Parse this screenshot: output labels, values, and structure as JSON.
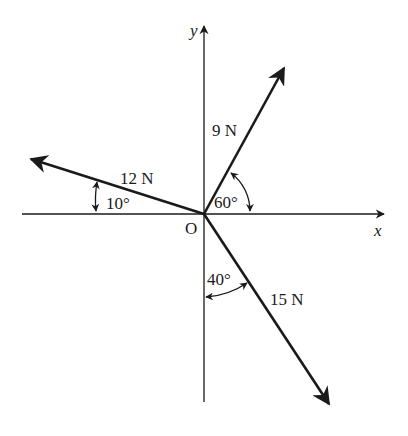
{
  "diagram": {
    "type": "force-vector-diagram",
    "origin_label": "O",
    "axes": {
      "x_label": "x",
      "y_label": "y"
    },
    "forces": [
      {
        "magnitude_label": "9 N",
        "angle_label": "60°",
        "angle_reference": "from positive x-axis",
        "direction": "upper-right"
      },
      {
        "magnitude_label": "12 N",
        "angle_label": "10°",
        "angle_reference": "above negative x-axis",
        "direction": "upper-left"
      },
      {
        "magnitude_label": "15 N",
        "angle_label": "40°",
        "angle_reference": "from negative y-axis",
        "direction": "lower-right"
      }
    ]
  },
  "colors": {
    "ink": "#1a1a1a",
    "background": "#ffffff"
  }
}
